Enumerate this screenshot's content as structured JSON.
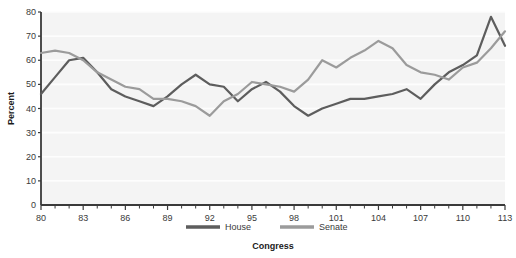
{
  "chart_data": {
    "type": "line",
    "title": "",
    "xlabel": "Congress",
    "ylabel": "Percent",
    "xlim": [
      80,
      113
    ],
    "ylim": [
      0,
      80
    ],
    "yticks": [
      0,
      10,
      20,
      30,
      40,
      50,
      60,
      70,
      80
    ],
    "xticks_major": [
      80,
      83,
      86,
      89,
      92,
      95,
      98,
      101,
      104,
      107,
      110,
      113
    ],
    "xticks_minor_every": 1,
    "grid": true,
    "legend_position": "bottom",
    "x": [
      80,
      81,
      82,
      83,
      84,
      85,
      86,
      87,
      88,
      89,
      90,
      91,
      92,
      93,
      94,
      95,
      96,
      97,
      98,
      99,
      100,
      101,
      102,
      103,
      104,
      105,
      106,
      107,
      108,
      109,
      110,
      111,
      112,
      113
    ],
    "series": [
      {
        "name": "House",
        "color": "#5d5d5d",
        "values": [
          46,
          53,
          60,
          61,
          55,
          48,
          45,
          43,
          41,
          45,
          50,
          54,
          50,
          49,
          43,
          48,
          51,
          47,
          41,
          37,
          40,
          42,
          44,
          44,
          45,
          46,
          48,
          44,
          50,
          55,
          58,
          62,
          78,
          66
        ]
      },
      {
        "name": "Senate",
        "color": "#9b9b9b",
        "values": [
          63,
          64,
          63,
          60,
          55,
          52,
          49,
          48,
          44,
          44,
          43,
          41,
          37,
          43,
          46,
          51,
          50,
          49,
          47,
          52,
          60,
          57,
          61,
          64,
          68,
          65,
          58,
          55,
          54,
          52,
          57,
          59,
          65,
          72
        ]
      }
    ]
  },
  "legend": {
    "items": [
      {
        "label": "House",
        "color": "#5d5d5d"
      },
      {
        "label": "Senate",
        "color": "#9b9b9b"
      }
    ]
  },
  "colors": {
    "plot_background": "#f4f4f4",
    "gridline": "#fdfdfd",
    "axis": "#3a3a3a",
    "house": "#5d5d5d",
    "senate": "#9b9b9b"
  }
}
